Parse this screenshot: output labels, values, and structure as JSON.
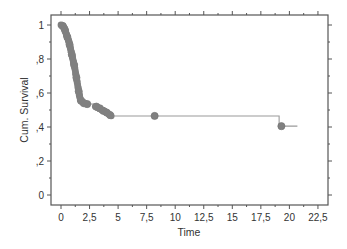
{
  "chart_data": {
    "type": "line",
    "subtype": "kaplan-meier-step",
    "title": "",
    "xlabel": "Time",
    "ylabel": "Cum. Survival",
    "xlim": [
      -0.9,
      23.5
    ],
    "ylim": [
      -0.06,
      1.06
    ],
    "x_ticks": [
      0,
      2.5,
      5,
      7.5,
      10,
      12.5,
      15,
      17.5,
      20,
      22.5
    ],
    "x_tick_labels": [
      "0",
      "2,5",
      "5",
      "7,5",
      "10",
      "12,5",
      "15",
      "17,5",
      "20",
      "22,5"
    ],
    "y_ticks": [
      0,
      0.2,
      0.4,
      0.6,
      0.8,
      1.0
    ],
    "y_tick_labels": [
      "0",
      ",2",
      ",4",
      ",6",
      ",8",
      "1"
    ],
    "grid": false,
    "legend": null,
    "series": [
      {
        "name": "Survival Function",
        "color": "#808080",
        "step_points": [
          [
            0.0,
            1.0
          ],
          [
            0.2,
            0.99
          ],
          [
            0.3,
            0.98
          ],
          [
            0.4,
            0.96
          ],
          [
            0.5,
            0.94
          ],
          [
            0.6,
            0.92
          ],
          [
            0.7,
            0.9
          ],
          [
            0.8,
            0.87
          ],
          [
            0.9,
            0.84
          ],
          [
            1.0,
            0.81
          ],
          [
            1.1,
            0.78
          ],
          [
            1.2,
            0.75
          ],
          [
            1.3,
            0.71
          ],
          [
            1.4,
            0.67
          ],
          [
            1.5,
            0.63
          ],
          [
            1.6,
            0.59
          ],
          [
            1.7,
            0.56
          ],
          [
            1.9,
            0.545
          ],
          [
            2.2,
            0.535
          ],
          [
            3.0,
            0.52
          ],
          [
            3.3,
            0.51
          ],
          [
            3.6,
            0.5
          ],
          [
            3.9,
            0.49
          ],
          [
            4.2,
            0.475
          ],
          [
            4.4,
            0.465
          ]
        ],
        "censored_points": [
          [
            0.15,
            0.995
          ],
          [
            0.35,
            0.97
          ],
          [
            0.55,
            0.93
          ],
          [
            0.75,
            0.885
          ],
          [
            0.95,
            0.825
          ],
          [
            1.15,
            0.765
          ],
          [
            1.35,
            0.69
          ],
          [
            1.55,
            0.61
          ],
          [
            1.75,
            0.555
          ],
          [
            2.0,
            0.54
          ],
          [
            2.3,
            0.535
          ],
          [
            3.1,
            0.52
          ],
          [
            3.4,
            0.51
          ],
          [
            3.7,
            0.495
          ],
          [
            4.0,
            0.485
          ],
          [
            4.3,
            0.47
          ],
          [
            8.2,
            0.465
          ],
          [
            19.3,
            0.405
          ]
        ],
        "flat_segments": [
          {
            "from": 4.4,
            "to": 19.1,
            "y": 0.465
          },
          {
            "from": 19.1,
            "to": 20.7,
            "y": 0.405
          }
        ]
      }
    ]
  }
}
